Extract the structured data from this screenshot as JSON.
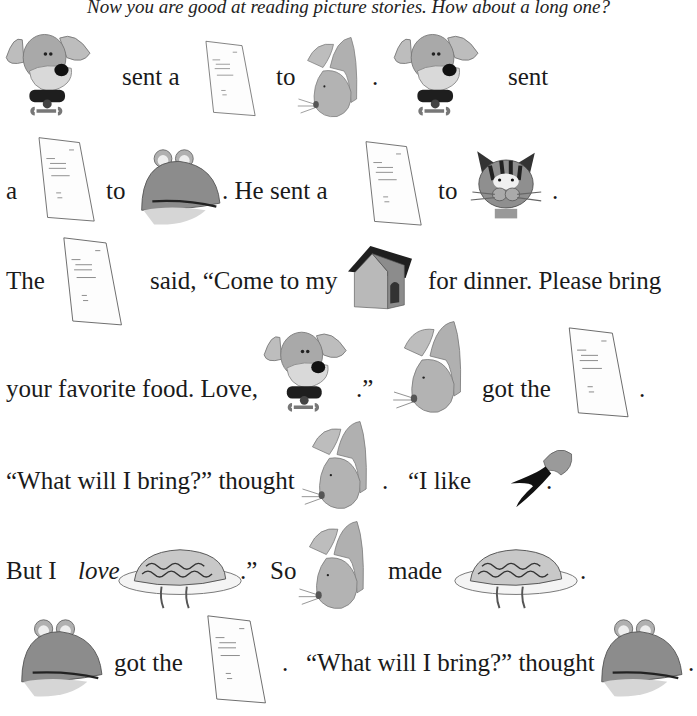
{
  "intro": "Now you are good at reading picture stories. How about a long one?",
  "icons": {
    "dog": "dog-icon",
    "rabbit": "rabbit-icon",
    "frog": "frog-icon",
    "cat": "cat-icon",
    "letter": "letter-icon",
    "doghouse": "doghouse-icon",
    "carrot": "carrot-icon",
    "spaghetti": "spaghetti-icon"
  },
  "lines": [
    {
      "t1": "sent a",
      "t2": "to",
      "t3": ".",
      "t4": "sent"
    },
    {
      "t1": "a",
      "t2": "to",
      "t3": ". He sent a",
      "t4": "to",
      "t5": "."
    },
    {
      "t1": "The",
      "t2": "said, “Come to my",
      "t3": "for dinner. Please bring"
    },
    {
      "t1": "your favorite food. Love,",
      "t2": ".”",
      "t3": "got the",
      "t4": "."
    },
    {
      "t1": "“What will I bring?” thought",
      "t2": ".",
      "t3": "“I like",
      "t4": "."
    },
    {
      "t1": "But I",
      "t1i": "love",
      "t2": ".”",
      "t3": "So",
      "t4": "made",
      "t5": "."
    },
    {
      "t1": "got the",
      "t2": ".",
      "t3": "“What will I bring?” thought",
      "t4": "."
    }
  ]
}
